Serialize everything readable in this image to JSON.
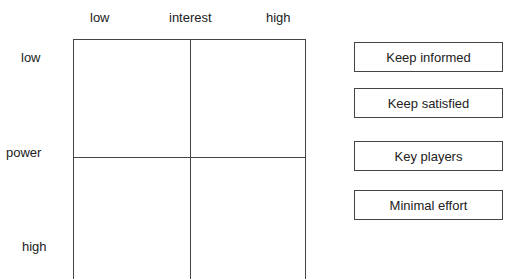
{
  "axes": {
    "x": {
      "title": "interest",
      "low": "low",
      "high": "high"
    },
    "y": {
      "title": "power",
      "low": "low",
      "high": "high"
    }
  },
  "strategies": [
    {
      "label": "Keep informed"
    },
    {
      "label": "Keep satisfied"
    },
    {
      "label": "Key players"
    },
    {
      "label": "Minimal effort"
    }
  ]
}
